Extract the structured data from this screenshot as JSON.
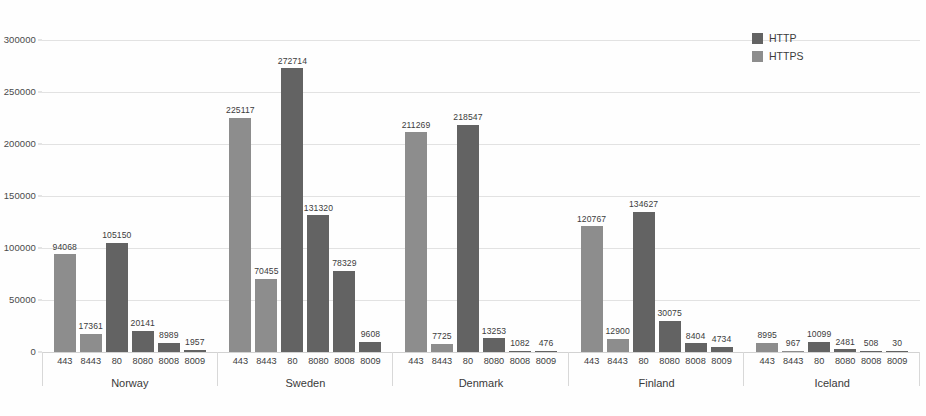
{
  "chart_data": {
    "type": "bar",
    "title": "",
    "xlabel": "",
    "ylabel": "",
    "ylim": [
      0,
      300000
    ],
    "ytick_values": [
      0,
      50000,
      100000,
      150000,
      200000,
      250000,
      300000
    ],
    "ytick_labels": [
      "0",
      "50000",
      "100000",
      "150000",
      "200000",
      "250000",
      "300000"
    ],
    "grid": true,
    "legend_position": "top-right",
    "legend": [
      "HTTP",
      "HTTPS"
    ],
    "categories": [
      "443",
      "8443",
      "80",
      "8080",
      "8008",
      "8009"
    ],
    "groups": [
      {
        "name": "Norway",
        "bars": [
          {
            "port": "443",
            "protocol": "HTTPS",
            "value": 94068,
            "label": "94068"
          },
          {
            "port": "8443",
            "protocol": "HTTPS",
            "value": 17361,
            "label": "17361"
          },
          {
            "port": "80",
            "protocol": "HTTP",
            "value": 105150,
            "label": "105150"
          },
          {
            "port": "8080",
            "protocol": "HTTP",
            "value": 20141,
            "label": "20141"
          },
          {
            "port": "8008",
            "protocol": "HTTP",
            "value": 8989,
            "label": "8989"
          },
          {
            "port": "8009",
            "protocol": "HTTP",
            "value": 1957,
            "label": "1957"
          }
        ]
      },
      {
        "name": "Sweden",
        "bars": [
          {
            "port": "443",
            "protocol": "HTTPS",
            "value": 225117,
            "label": "225117"
          },
          {
            "port": "8443",
            "protocol": "HTTPS",
            "value": 70455,
            "label": "70455"
          },
          {
            "port": "80",
            "protocol": "HTTP",
            "value": 272714,
            "label": "272714"
          },
          {
            "port": "8080",
            "protocol": "HTTP",
            "value": 131320,
            "label": "131320"
          },
          {
            "port": "8008",
            "protocol": "HTTP",
            "value": 78329,
            "label": "78329"
          },
          {
            "port": "8009",
            "protocol": "HTTP",
            "value": 9608,
            "label": "9608"
          }
        ]
      },
      {
        "name": "Denmark",
        "bars": [
          {
            "port": "443",
            "protocol": "HTTPS",
            "value": 211269,
            "label": "211269"
          },
          {
            "port": "8443",
            "protocol": "HTTPS",
            "value": 7725,
            "label": "7725"
          },
          {
            "port": "80",
            "protocol": "HTTP",
            "value": 218547,
            "label": "218547"
          },
          {
            "port": "8080",
            "protocol": "HTTP",
            "value": 13253,
            "label": "13253"
          },
          {
            "port": "8008",
            "protocol": "HTTP",
            "value": 1082,
            "label": "1082"
          },
          {
            "port": "8009",
            "protocol": "HTTP",
            "value": 476,
            "label": "476"
          }
        ]
      },
      {
        "name": "Finland",
        "bars": [
          {
            "port": "443",
            "protocol": "HTTPS",
            "value": 120767,
            "label": "120767"
          },
          {
            "port": "8443",
            "protocol": "HTTPS",
            "value": 12900,
            "label": "12900"
          },
          {
            "port": "80",
            "protocol": "HTTP",
            "value": 134627,
            "label": "134627"
          },
          {
            "port": "8080",
            "protocol": "HTTP",
            "value": 30075,
            "label": "30075"
          },
          {
            "port": "8008",
            "protocol": "HTTP",
            "value": 8404,
            "label": "8404"
          },
          {
            "port": "8009",
            "protocol": "HTTP",
            "value": 4734,
            "label": "4734"
          }
        ]
      },
      {
        "name": "Iceland",
        "bars": [
          {
            "port": "443",
            "protocol": "HTTPS",
            "value": 8995,
            "label": "8995"
          },
          {
            "port": "8443",
            "protocol": "HTTPS",
            "value": 967,
            "label": "967"
          },
          {
            "port": "80",
            "protocol": "HTTP",
            "value": 10099,
            "label": "10099"
          },
          {
            "port": "8080",
            "protocol": "HTTP",
            "value": 2481,
            "label": "2481"
          },
          {
            "port": "8008",
            "protocol": "HTTP",
            "value": 508,
            "label": "508"
          },
          {
            "port": "8009",
            "protocol": "HTTP",
            "value": 30,
            "label": "30"
          }
        ]
      }
    ]
  },
  "colors": {
    "http": "#636363",
    "https": "#8d8d8d",
    "grid": "#e2e2e2",
    "text": "#3c3c3c",
    "background": "#fefefe"
  }
}
